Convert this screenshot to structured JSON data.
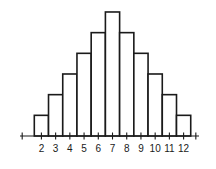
{
  "chart_data": {
    "type": "bar",
    "title": "",
    "xlabel": "",
    "ylabel": "",
    "categories": [
      "2",
      "3",
      "4",
      "5",
      "6",
      "7",
      "8",
      "9",
      "10",
      "11",
      "12"
    ],
    "values": [
      1,
      2,
      3,
      4,
      5,
      6,
      5,
      4,
      3,
      2,
      1
    ],
    "ylim": [
      0,
      6
    ],
    "grid": false,
    "legend": null,
    "histogram": true,
    "y_axis_visible": false
  },
  "colors": {
    "stroke": "#1a1a1a",
    "fill": "#ffffff",
    "background": "#ffffff"
  }
}
